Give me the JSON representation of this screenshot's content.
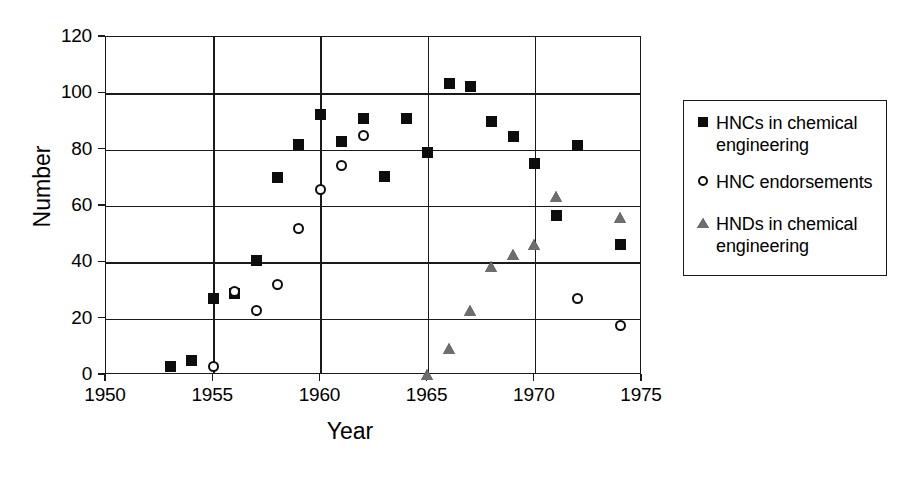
{
  "chart_data": {
    "type": "scatter",
    "title": "",
    "xlabel": "Year",
    "ylabel": "Number",
    "xlim": [
      1950,
      1975
    ],
    "ylim": [
      0,
      120
    ],
    "xticks": [
      1950,
      1955,
      1960,
      1965,
      1970,
      1975
    ],
    "yticks": [
      0,
      20,
      40,
      60,
      80,
      100,
      120
    ],
    "grid": "both",
    "legend_position": "right-outside",
    "series": [
      {
        "name": "HNCs in chemical engineering",
        "marker": "filled-square",
        "color": "#0d0d0d",
        "points": [
          {
            "x": 1953,
            "y": 3
          },
          {
            "x": 1954,
            "y": 5
          },
          {
            "x": 1955,
            "y": 27
          },
          {
            "x": 1956,
            "y": 29
          },
          {
            "x": 1957,
            "y": 40.5
          },
          {
            "x": 1958,
            "y": 70
          },
          {
            "x": 1959,
            "y": 82
          },
          {
            "x": 1960,
            "y": 92.5
          },
          {
            "x": 1961,
            "y": 83
          },
          {
            "x": 1962,
            "y": 91
          },
          {
            "x": 1963,
            "y": 70.5
          },
          {
            "x": 1964,
            "y": 91
          },
          {
            "x": 1965,
            "y": 79
          },
          {
            "x": 1966,
            "y": 103.5
          },
          {
            "x": 1967,
            "y": 102.5
          },
          {
            "x": 1968,
            "y": 90
          },
          {
            "x": 1969,
            "y": 84.5
          },
          {
            "x": 1970,
            "y": 75
          },
          {
            "x": 1971,
            "y": 56.5
          },
          {
            "x": 1972,
            "y": 81.5
          },
          {
            "x": 1974,
            "y": 46.5
          }
        ]
      },
      {
        "name": "HNC endorsements",
        "marker": "open-circle",
        "color": "#0d0d0d",
        "points": [
          {
            "x": 1955,
            "y": 3
          },
          {
            "x": 1956,
            "y": 29.5
          },
          {
            "x": 1957,
            "y": 23
          },
          {
            "x": 1958,
            "y": 32
          },
          {
            "x": 1959,
            "y": 52
          },
          {
            "x": 1960,
            "y": 66
          },
          {
            "x": 1961,
            "y": 74.5
          },
          {
            "x": 1962,
            "y": 85
          },
          {
            "x": 1972,
            "y": 27
          },
          {
            "x": 1974,
            "y": 17.5
          }
        ]
      },
      {
        "name": "HNDs in chemical engineering",
        "marker": "filled-triangle",
        "color": "#6e6e6e",
        "points": [
          {
            "x": 1965,
            "y": 0
          },
          {
            "x": 1966,
            "y": 9
          },
          {
            "x": 1967,
            "y": 22.5
          },
          {
            "x": 1968,
            "y": 38
          },
          {
            "x": 1969,
            "y": 42.5
          },
          {
            "x": 1970,
            "y": 46
          },
          {
            "x": 1971,
            "y": 63
          },
          {
            "x": 1974,
            "y": 55.5
          }
        ]
      }
    ]
  },
  "axes": {
    "y_title": "Number",
    "x_title": "Year",
    "y_tick_labels": [
      "0",
      "20",
      "40",
      "60",
      "80",
      "100",
      "120"
    ],
    "x_tick_labels": [
      "1950",
      "1955",
      "1960",
      "1965",
      "1970",
      "1975"
    ]
  },
  "legend": {
    "entries": [
      {
        "label": "HNCs in chemical engineering",
        "icon": "filled-square-marker-icon"
      },
      {
        "label": "HNC endorsements",
        "icon": "open-circle-marker-icon"
      },
      {
        "label": "HNDs in chemical engineering",
        "icon": "filled-triangle-marker-icon"
      }
    ]
  }
}
